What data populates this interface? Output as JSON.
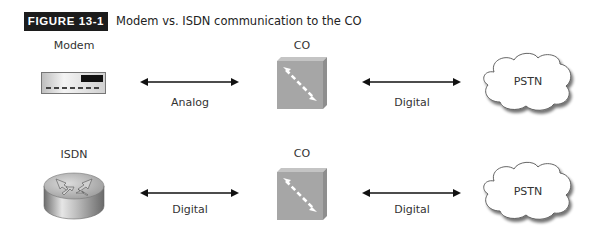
{
  "figure": {
    "label": "FIGURE 13-1",
    "caption": "Modem vs. ISDN communication to the CO"
  },
  "rows": [
    {
      "device": {
        "label": "Modem",
        "icon": "modem-icon"
      },
      "link1": {
        "label": "Analog"
      },
      "co": {
        "label": "CO",
        "icon": "switch-icon"
      },
      "link2": {
        "label": "Digital"
      },
      "network": {
        "label": "PSTN",
        "icon": "cloud-icon"
      }
    },
    {
      "device": {
        "label": "ISDN",
        "icon": "router-icon"
      },
      "link1": {
        "label": "Digital"
      },
      "co": {
        "label": "CO",
        "icon": "switch-icon"
      },
      "link2": {
        "label": "Digital"
      },
      "network": {
        "label": "PSTN",
        "icon": "cloud-icon"
      }
    }
  ],
  "colors": {
    "label_bg": "#1c1c1c",
    "switch_gray": "#a6a6a6",
    "arrow": "#111111"
  }
}
